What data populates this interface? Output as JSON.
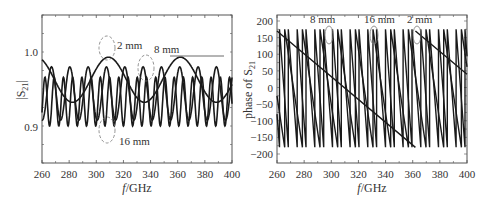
{
  "chart_data": [
    {
      "type": "line",
      "title": "",
      "xlabel": "f/GHz",
      "ylabel": "|S21|",
      "xlim": [
        260,
        400
      ],
      "ylim": [
        0.85,
        1.05
      ],
      "xticks": [
        260,
        280,
        300,
        320,
        340,
        360,
        380,
        400
      ],
      "yticks": [
        0.9,
        1.0
      ],
      "ytick_labels": [
        "0.9",
        "1.0"
      ],
      "grid": false,
      "series": [
        {
          "name": "2 mm",
          "description": "slow oscillation, period ~53 GHz, range ~0.93-0.993",
          "period_GHz": 53,
          "min": 0.932,
          "max": 0.993,
          "peak_at": [
            309,
            362
          ]
        },
        {
          "name": "8 mm",
          "description": "medium oscillation, period ~14 GHz, range ~0.91-0.98",
          "period_GHz": 13.5,
          "min": 0.908,
          "max": 0.98
        },
        {
          "name": "16 mm",
          "description": "fast oscillation, period ~7 GHz, range ~0.90-0.965",
          "period_GHz": 6.8,
          "min": 0.9,
          "max": 0.966
        }
      ],
      "annotations": [
        {
          "text": "2 mm",
          "x": 315,
          "y": 1.005
        },
        {
          "text": "8 mm",
          "x": 346,
          "y": 0.998
        },
        {
          "text": "16 mm",
          "x": 316,
          "y": 0.877
        }
      ]
    },
    {
      "type": "line",
      "title": "",
      "xlabel": "f/GHz",
      "ylabel": "phase of S21",
      "xlim": [
        260,
        400
      ],
      "ylim": [
        -225,
        220
      ],
      "xticks": [
        260,
        280,
        300,
        320,
        340,
        360,
        380,
        400
      ],
      "yticks": [
        -200,
        -150,
        -100,
        -50,
        0,
        50,
        100,
        150,
        200
      ],
      "grid": false,
      "series": [
        {
          "name": "2 mm",
          "description": "sawtooth phase wrap, slope ~-3.4 deg/GHz, wraps at ~362 GHz",
          "points": [
            [
              260,
              170
            ],
            [
              362,
              -180
            ],
            [
              362,
              170
            ],
            [
              400,
              40
            ]
          ]
        },
        {
          "name": "8 mm",
          "description": "sawtooth phase wrap, period ~13 GHz",
          "wrap_period_GHz": 13.2
        },
        {
          "name": "16 mm",
          "description": "sawtooth phase wrap, period ~6.5 GHz",
          "wrap_period_GHz": 6.6
        }
      ],
      "annotations": [
        {
          "text": "8 mm",
          "x": 298
        },
        {
          "text": "16 mm",
          "x": 332
        },
        {
          "text": "2 mm",
          "x": 363
        }
      ]
    }
  ],
  "left": {
    "ylabel": "|S",
    "ylabel_sub": "21",
    "ylabel_end": "|",
    "xlabel_italic": "f",
    "xlabel_rest": "/GHz",
    "xticks": [
      "260",
      "280",
      "300",
      "320",
      "340",
      "360",
      "380",
      "400"
    ],
    "yticks": [
      "1.0",
      "0.9"
    ],
    "annot_2mm": "2 mm",
    "annot_8mm": "8 mm",
    "annot_16mm": "16 mm"
  },
  "right": {
    "ylabel": "phase of S",
    "ylabel_sub": "21",
    "xlabel_italic": "f",
    "xlabel_rest": "/GHz",
    "xticks": [
      "260",
      "280",
      "300",
      "320",
      "340",
      "360",
      "380",
      "400"
    ],
    "yticks": [
      "200",
      "150",
      "100",
      "50",
      "0",
      "−50",
      "−100",
      "−150",
      "−200"
    ],
    "annot_8mm": "8 mm",
    "annot_16mm": "16 mm",
    "annot_2mm": "2 mm"
  }
}
